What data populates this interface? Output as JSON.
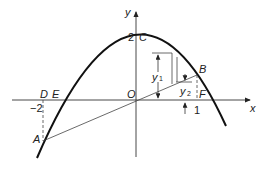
{
  "diagram": {
    "type": "parabola-area-between-curve-and-chord",
    "axes": {
      "x_label": "x",
      "y_label": "y"
    },
    "points": {
      "O": "O",
      "C": "C",
      "A": "A",
      "B": "B",
      "D": "D",
      "E": "E",
      "F": "F"
    },
    "ticks": {
      "y_intercept": "2",
      "x_neg": "−2",
      "x_pos": "1"
    },
    "strip_labels": {
      "y1": "y",
      "y1_sub": "1",
      "y2": "y",
      "y2_sub": "2"
    },
    "colors": {
      "curve": "#111111",
      "lines": "#333333"
    }
  }
}
